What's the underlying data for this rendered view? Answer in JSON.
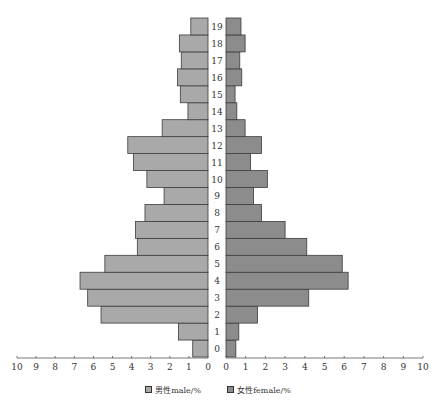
{
  "chart_data": {
    "type": "bar",
    "subtype": "population-pyramid",
    "orientation": "horizontal",
    "categories": [
      "0",
      "1",
      "2",
      "3",
      "4",
      "5",
      "6",
      "7",
      "8",
      "9",
      "10",
      "11",
      "12",
      "13",
      "14",
      "15",
      "16",
      "17",
      "18",
      "19"
    ],
    "series": [
      {
        "name": "男性male/%",
        "side": "left",
        "color": "#a9a9a9",
        "values": [
          0.8,
          1.55,
          5.6,
          6.3,
          6.7,
          5.4,
          3.7,
          3.8,
          3.3,
          2.3,
          3.2,
          3.9,
          4.2,
          2.4,
          1.05,
          1.45,
          1.6,
          1.4,
          1.5,
          0.9
        ]
      },
      {
        "name": "女性female/%",
        "side": "right",
        "color": "#8c8c8c",
        "values": [
          0.5,
          0.65,
          1.6,
          4.2,
          6.2,
          5.9,
          4.1,
          3.0,
          1.8,
          1.4,
          2.1,
          1.25,
          1.8,
          0.97,
          0.55,
          0.46,
          0.8,
          0.7,
          0.97,
          0.76
        ]
      }
    ],
    "title": "",
    "xlabel": "",
    "ylabel": "",
    "xlim": [
      0,
      10
    ],
    "x_ticks_left": [
      "10",
      "9",
      "8",
      "7",
      "6",
      "5",
      "4",
      "3",
      "2",
      "1",
      "0"
    ],
    "x_ticks_right": [
      "0",
      "1",
      "2",
      "3",
      "4",
      "5",
      "6",
      "7",
      "8",
      "9",
      "10"
    ],
    "grid": false,
    "legend_position": "bottom"
  },
  "legend": {
    "male": "男性male/%",
    "female": "女性female/%"
  }
}
